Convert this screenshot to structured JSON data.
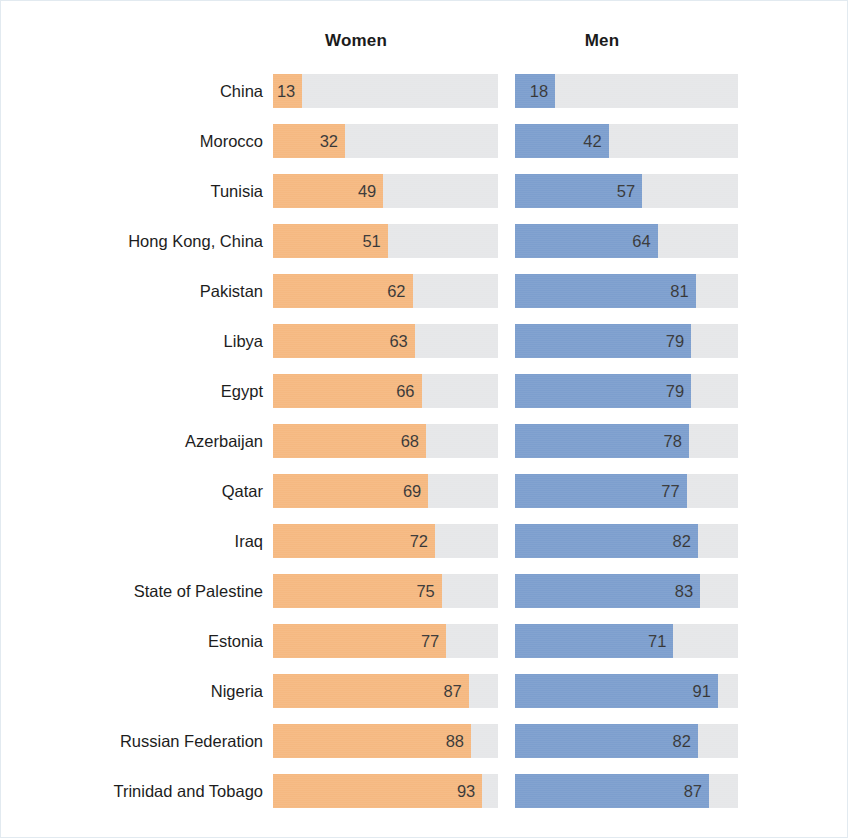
{
  "chart_data": {
    "type": "bar",
    "title": "",
    "subtitle": "",
    "xlabel": "",
    "ylabel": "",
    "xlim": [
      0,
      100
    ],
    "grid": false,
    "legend_position": "top",
    "orientation": "horizontal",
    "layout": "paired-columns",
    "categories": [
      "China",
      "Morocco",
      "Tunisia",
      "Hong Kong, China",
      "Pakistan",
      "Libya",
      "Egypt",
      "Azerbaijan",
      "Qatar",
      "Iraq",
      "State of Palestine",
      "Estonia",
      "Nigeria",
      "Russian Federation",
      "Trinidad and Tobago"
    ],
    "series": [
      {
        "name": "Women",
        "color": "#f4b072",
        "values": [
          13,
          32,
          49,
          51,
          62,
          63,
          66,
          68,
          69,
          72,
          75,
          77,
          87,
          88,
          93
        ]
      },
      {
        "name": "Men",
        "color": "#6d93c8",
        "values": [
          18,
          42,
          57,
          64,
          81,
          79,
          79,
          78,
          77,
          82,
          83,
          71,
          91,
          82,
          87
        ]
      }
    ],
    "track_color": "#e3e4e6",
    "value_labels": true
  },
  "headers": {
    "women": "Women",
    "men": "Men"
  },
  "rows": [
    {
      "label": "China",
      "women": "13",
      "men": "18",
      "women_pct": 13,
      "men_pct": 18
    },
    {
      "label": "Morocco",
      "women": "32",
      "men": "42",
      "women_pct": 32,
      "men_pct": 42
    },
    {
      "label": "Tunisia",
      "women": "49",
      "men": "57",
      "women_pct": 49,
      "men_pct": 57
    },
    {
      "label": "Hong Kong, China",
      "women": "51",
      "men": "64",
      "women_pct": 51,
      "men_pct": 64
    },
    {
      "label": "Pakistan",
      "women": "62",
      "men": "81",
      "women_pct": 62,
      "men_pct": 81
    },
    {
      "label": "Libya",
      "women": "63",
      "men": "79",
      "women_pct": 63,
      "men_pct": 79
    },
    {
      "label": "Egypt",
      "women": "66",
      "men": "79",
      "women_pct": 66,
      "men_pct": 79
    },
    {
      "label": "Azerbaijan",
      "women": "68",
      "men": "78",
      "women_pct": 68,
      "men_pct": 78
    },
    {
      "label": "Qatar",
      "women": "69",
      "men": "77",
      "women_pct": 69,
      "men_pct": 77
    },
    {
      "label": "Iraq",
      "women": "72",
      "men": "82",
      "women_pct": 72,
      "men_pct": 82
    },
    {
      "label": "State of Palestine",
      "women": "75",
      "men": "83",
      "women_pct": 75,
      "men_pct": 83
    },
    {
      "label": "Estonia",
      "women": "77",
      "men": "71",
      "women_pct": 77,
      "men_pct": 71
    },
    {
      "label": "Nigeria",
      "women": "87",
      "men": "91",
      "women_pct": 87,
      "men_pct": 91
    },
    {
      "label": "Russian Federation",
      "women": "88",
      "men": "82",
      "women_pct": 88,
      "men_pct": 82
    },
    {
      "label": "Trinidad and Tobago",
      "women": "93",
      "men": "87",
      "women_pct": 93,
      "men_pct": 87
    }
  ]
}
